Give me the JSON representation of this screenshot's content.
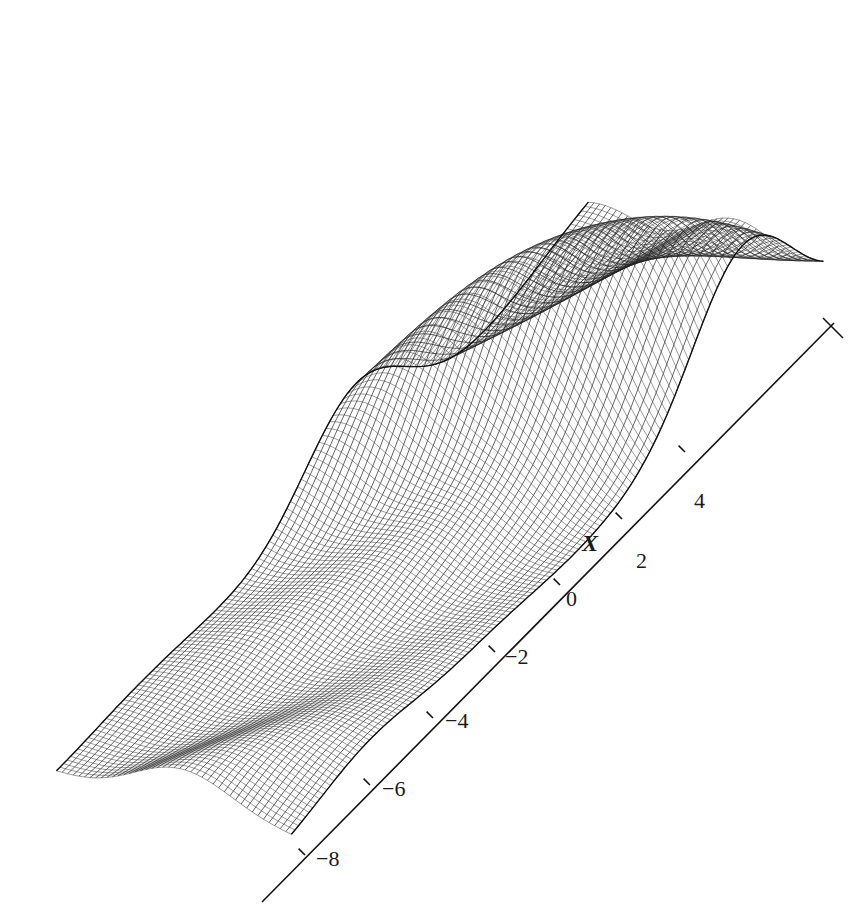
{
  "chart_data": {
    "type": "surface-wireframe",
    "title": "",
    "xlabel": "X",
    "x_ticks": [
      "-8",
      "-6",
      "-4",
      "-2",
      "0",
      "2",
      "4"
    ],
    "x_tick_values": [
      -8,
      -6,
      -4,
      -2,
      0,
      2,
      4
    ],
    "xlim": [
      -9.5,
      5.5
    ],
    "grid": false,
    "legend": "none",
    "ridges": [
      {
        "x_approx": -8.5,
        "relative_peak_height": 0.25
      },
      {
        "x_approx": -6.5,
        "relative_peak_height": 0.45
      },
      {
        "x_approx": -4.0,
        "relative_peak_height": 0.6
      },
      {
        "x_approx": -1.0,
        "relative_peak_height": 0.8
      },
      {
        "x_approx": 2.5,
        "relative_peak_height": 1.0
      },
      {
        "x_approx": 4.5,
        "relative_peak_height": 0.7
      }
    ],
    "line_color": "#222222",
    "background": "#ffffff"
  },
  "axis": {
    "label": "X",
    "ticks": [
      {
        "label": "−8",
        "x": 305,
        "y": 855
      },
      {
        "label": "−6",
        "x": 370,
        "y": 785
      },
      {
        "label": "−4",
        "x": 433,
        "y": 718
      },
      {
        "label": "−2",
        "x": 495,
        "y": 652
      },
      {
        "label": "0",
        "x": 560,
        "y": 585
      },
      {
        "label": "2",
        "x": 622,
        "y": 519
      },
      {
        "label": "4",
        "x": 685,
        "y": 452
      }
    ]
  }
}
